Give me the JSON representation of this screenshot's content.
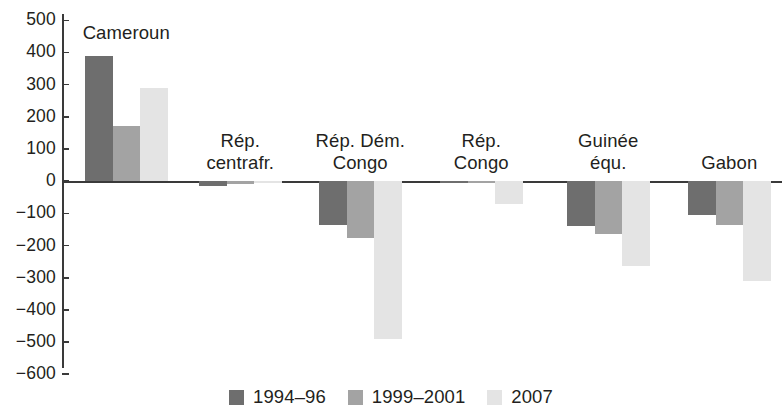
{
  "chart_data": {
    "type": "bar",
    "title": "",
    "subtitle": "",
    "xlabel": "",
    "ylabel": "",
    "ylim": [
      -600,
      500
    ],
    "ytick_step": 100,
    "grid": false,
    "legend_position": "bottom-center",
    "orientation": "vertical",
    "grouping": "grouped",
    "categories": [
      "Cameroun",
      "Rép. centrafr.",
      "Rép. Dém. Congo",
      "Rép. Congo",
      "Guinée équ.",
      "Gabon"
    ],
    "category_label_lines": [
      [
        "Cameroun"
      ],
      [
        "Rép.",
        "centrafr."
      ],
      [
        "Rép. Dém.",
        "Congo"
      ],
      [
        "Rép.",
        "Congo"
      ],
      [
        "Guinée",
        "équ."
      ],
      [
        "Gabon"
      ]
    ],
    "ytick_labels": [
      "500",
      "400",
      "300",
      "200",
      "100",
      "0",
      "−100",
      "−200",
      "−300",
      "−400",
      "−500",
      "−600"
    ],
    "ytick_values": [
      500,
      400,
      300,
      200,
      100,
      0,
      -100,
      -200,
      -300,
      -400,
      -500,
      -600
    ],
    "series": [
      {
        "name": "1994–96",
        "color": "#6e6e6e",
        "values": [
          390,
          -15,
          -135,
          -5,
          -140,
          -105
        ]
      },
      {
        "name": "1999–2001",
        "color": "#a3a3a3",
        "values": [
          170,
          -10,
          -175,
          -5,
          -165,
          -135
        ]
      },
      {
        "name": "2007",
        "color": "#e4e4e4",
        "values": [
          290,
          -5,
          -490,
          -70,
          -265,
          -310
        ]
      }
    ]
  },
  "legend": {
    "items": [
      {
        "label": "1994–96",
        "color": "#6e6e6e",
        "swatch_name": "legend-swatch-1994-96"
      },
      {
        "label": "1999–2001",
        "color": "#a3a3a3",
        "swatch_name": "legend-swatch-1999-2001"
      },
      {
        "label": "2007",
        "color": "#e4e4e4",
        "swatch_name": "legend-swatch-2007"
      }
    ]
  },
  "axis": {
    "y_axis_color": "#3a3a3a",
    "zero_line_color": "#3a3a3a"
  },
  "layout": {
    "plot_left": 62,
    "plot_right": 782,
    "y_top_px": 14,
    "y_bottom_px": 368,
    "zero_y_px": 181.2,
    "px_per_unit": 0.3218,
    "bar_width": 27.5,
    "group_starts": [
      85,
      199,
      319,
      440,
      567,
      688
    ]
  }
}
